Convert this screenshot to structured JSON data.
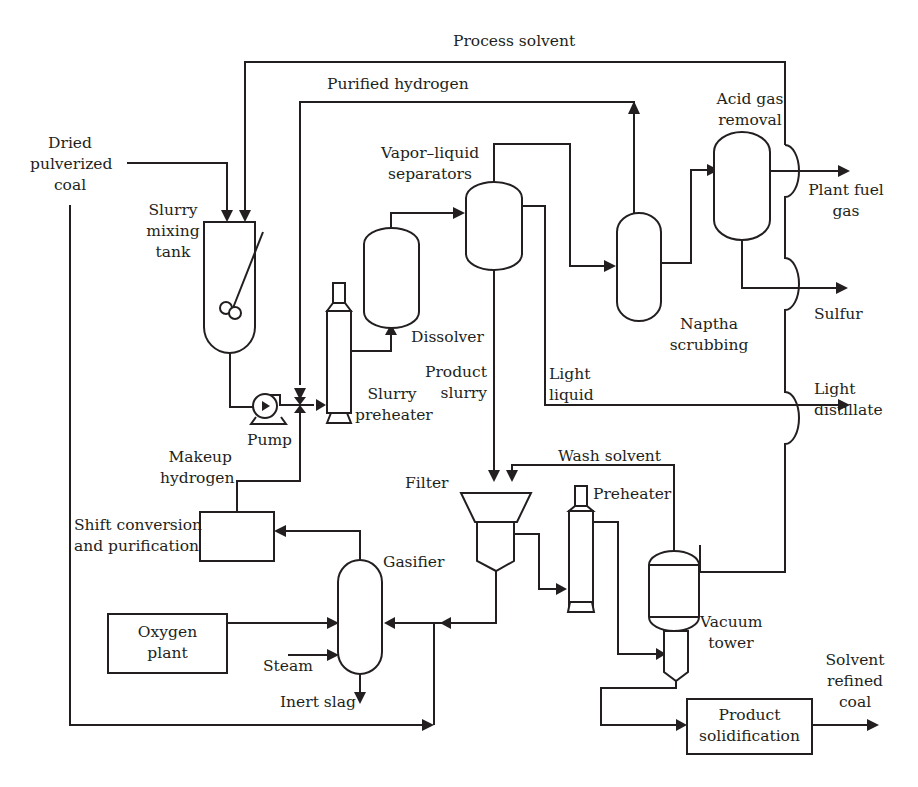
{
  "diagram": {
    "type": "process-flow-diagram",
    "colors": {
      "line": "#231f20",
      "background": "#ffffff"
    }
  },
  "streams": {
    "process_solvent": "Process solvent",
    "purified_hydrogen": "Purified hydrogen",
    "dried_coal": "Dried\npulverized\ncoal",
    "makeup_hydrogen": "Makeup\nhydrogen",
    "product_slurry": "Product\nslurry",
    "light_liquid": "Light\nliquid",
    "wash_solvent": "Wash solvent",
    "steam": "Steam",
    "inert_slag": "Inert slag"
  },
  "equipment": {
    "slurry_mixing_tank": "Slurry\nmixing\ntank",
    "pump": "Pump",
    "slurry_preheater": "Slurry\npreheater",
    "dissolver": "Dissolver",
    "vapor_liquid_separators": "Vapor–liquid\nseparators",
    "naptha_scrubbing": "Naptha\nscrubbing",
    "acid_gas_removal": "Acid gas\nremoval",
    "filter": "Filter",
    "preheater": "Preheater",
    "vacuum_tower": "Vacuum\ntower",
    "shift_conversion": "Shift conversion\nand purification",
    "gasifier": "Gasifier",
    "oxygen_plant": "Oxygen\nplant",
    "product_solidification": "Product\nsolidification"
  },
  "outputs": {
    "plant_fuel_gas": "Plant fuel\ngas",
    "sulfur": "Sulfur",
    "light_distillate": "Light\ndistillate",
    "solvent_refined_coal": "Solvent\nrefined\ncoal"
  }
}
